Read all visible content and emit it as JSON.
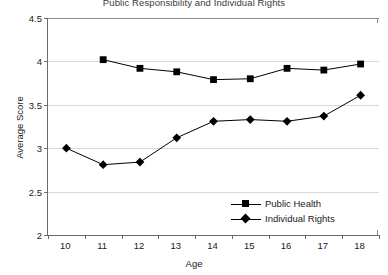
{
  "chart_data": {
    "type": "line",
    "title": "Public Responsibility and Individual Rights",
    "xlabel": "Age",
    "ylabel": "Average Score",
    "x": [
      10,
      11,
      12,
      13,
      14,
      15,
      16,
      17,
      18
    ],
    "categories": [
      "10",
      "11",
      "12",
      "13",
      "14",
      "15",
      "16",
      "17",
      "18"
    ],
    "xlim": [
      9.5,
      18.5
    ],
    "ylim": [
      2,
      4.5
    ],
    "yticks": [
      2,
      2.5,
      3,
      3.5,
      4,
      4.5
    ],
    "ytick_labels": [
      "2",
      "2.5",
      "3",
      "3.5",
      "4",
      "4.5"
    ],
    "grid": "horizontal",
    "legend_position": "bottom-right",
    "series": [
      {
        "name": "Public Health",
        "marker": "square",
        "color": "#000000",
        "x": [
          11,
          12,
          13,
          14,
          15,
          16,
          17,
          18
        ],
        "values": [
          4.02,
          3.92,
          3.88,
          3.79,
          3.8,
          3.92,
          3.9,
          3.97
        ]
      },
      {
        "name": "Individual Rights",
        "marker": "diamond",
        "color": "#000000",
        "x": [
          10,
          11,
          12,
          13,
          14,
          15,
          16,
          17,
          18
        ],
        "values": [
          3.0,
          2.81,
          2.84,
          3.12,
          3.31,
          3.33,
          3.31,
          3.37,
          3.61
        ]
      }
    ]
  },
  "legend": {
    "items": [
      {
        "label": "Public Health"
      },
      {
        "label": "Individual Rights"
      }
    ]
  }
}
